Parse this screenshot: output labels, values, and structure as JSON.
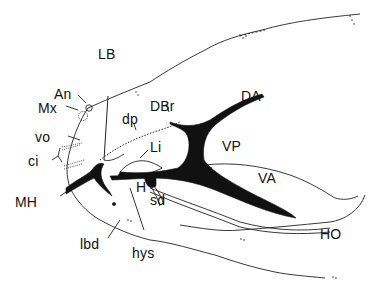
{
  "figure": {
    "type": "anatomical line drawing (lateral view of fish head / hyoid and branchiostegal region)",
    "background": "#ffffff",
    "ink": "#111111",
    "labels": {
      "LB": "LB",
      "An": "An",
      "Mx": "Mx",
      "vo": "vo",
      "ci": "ci",
      "MH": "MH",
      "dp": "dp",
      "DBr": "DBr",
      "DA": "DA",
      "Li": "Li",
      "VP": "VP",
      "VA": "VA",
      "H": "H",
      "sd": "sd",
      "lbd": "lbd",
      "hys": "hys",
      "HO": "HO"
    }
  }
}
